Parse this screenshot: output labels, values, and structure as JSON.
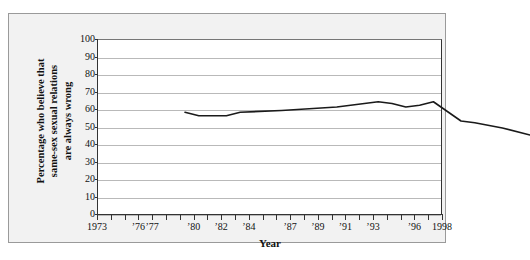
{
  "chart_data": {
    "type": "line",
    "title": "",
    "xlabel": "Year",
    "ylabel": "Percentage who believe that same-sex sexual relations are always wrong",
    "ylabel_lines": [
      "Percentage who believe that",
      "same-sex sexual relations",
      "are always wrong"
    ],
    "ylim": [
      0,
      100
    ],
    "ytick_values": [
      0,
      10,
      20,
      30,
      40,
      50,
      60,
      70,
      80,
      90,
      100
    ],
    "ytick_labels": [
      "0",
      "10",
      "20",
      "30",
      "40",
      "50",
      "60",
      "70",
      "80",
      "90",
      "100"
    ],
    "xlim": [
      1973,
      1998
    ],
    "xtick_values": [
      1973,
      1974,
      1975,
      1976,
      1977,
      1978,
      1979,
      1980,
      1981,
      1982,
      1983,
      1984,
      1985,
      1986,
      1987,
      1988,
      1989,
      1990,
      1991,
      1992,
      1993,
      1994,
      1995,
      1996,
      1997,
      1998
    ],
    "xtick_labeled": [
      {
        "value": 1973,
        "label": "1973"
      },
      {
        "value": 1976,
        "label": "’76"
      },
      {
        "value": 1977,
        "label": "’77"
      },
      {
        "value": 1980,
        "label": "’80"
      },
      {
        "value": 1982,
        "label": "’82"
      },
      {
        "value": 1984,
        "label": "’84"
      },
      {
        "value": 1987,
        "label": "’87"
      },
      {
        "value": 1989,
        "label": "’89"
      },
      {
        "value": 1991,
        "label": "’91"
      },
      {
        "value": 1993,
        "label": "’93"
      },
      {
        "value": 1996,
        "label": "’96"
      },
      {
        "value": 1998,
        "label": "1998"
      }
    ],
    "grid": true,
    "grid_axis": "y",
    "legend": null,
    "line_color": "#1a1a1a",
    "grid_color": "#b9b9b9",
    "axis_color": "#333333",
    "plot_background": "#ffffff",
    "figure_background": "#f2f2f2",
    "series": [
      {
        "name": "Percentage who believe same-sex sexual relations are always wrong",
        "x": [
          1973,
          1974,
          1976,
          1977,
          1980,
          1982,
          1984,
          1985,
          1987,
          1988,
          1989,
          1990,
          1991,
          1993,
          1994,
          1996,
          1998
        ],
        "values": [
          73,
          71,
          71,
          73,
          74,
          75,
          76,
          77,
          79,
          78,
          76,
          77,
          79,
          68,
          67,
          64,
          60
        ]
      }
    ]
  }
}
